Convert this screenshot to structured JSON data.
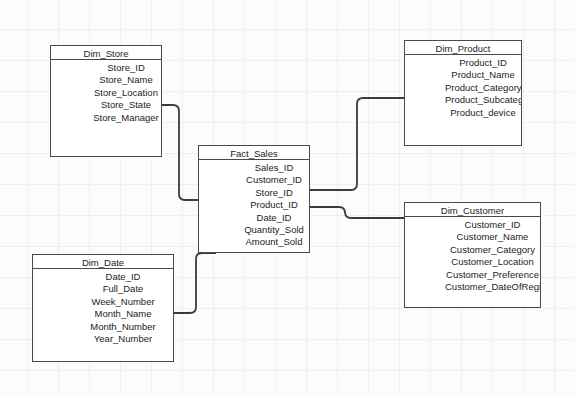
{
  "diagram": {
    "type": "entity-relationship-diagram",
    "canvas": {
      "width": 575,
      "height": 395,
      "background": "#fcfcfc",
      "grid_pitch": 31
    },
    "style": {
      "border_color": "#4a4a4a",
      "fill_color": "#ffffff",
      "text_color": "#1c1c1c",
      "connector_color": "#3c3c3c"
    },
    "entities": [
      {
        "id": "dim_store",
        "name": "Dim_Store",
        "kind": "dimension",
        "x": 50,
        "y": 45,
        "width": 112,
        "height": 112,
        "fields": [
          "Store_ID",
          "Store_Name",
          "Store_Location",
          "Store_State",
          "Store_Manager"
        ]
      },
      {
        "id": "fact_sales",
        "name": "Fact_Sales",
        "kind": "fact",
        "x": 198,
        "y": 145,
        "width": 112,
        "height": 108,
        "fields": [
          "Sales_ID",
          "Customer_ID",
          "Store_ID",
          "Product_ID",
          "Date_ID",
          "Quantity_Sold",
          "Amount_Sold"
        ]
      },
      {
        "id": "dim_product",
        "name": "Dim_Product",
        "kind": "dimension",
        "x": 404,
        "y": 40,
        "width": 118,
        "height": 106,
        "fields": [
          "Product_ID",
          "Product_Name",
          "Product_Category",
          "Product_Subcategory",
          "Product_device"
        ]
      },
      {
        "id": "dim_customer",
        "name": "Dim_Customer",
        "kind": "dimension",
        "x": 404,
        "y": 202,
        "width": 137,
        "height": 106,
        "fields": [
          "Customer_ID",
          "Customer_Name",
          "Customer_Category",
          "Customer_Location",
          "Customer_Preference",
          "Customer_DateOfRegistration"
        ]
      },
      {
        "id": "dim_date",
        "name": "Dim_Date",
        "kind": "dimension",
        "x": 32,
        "y": 254,
        "width": 142,
        "height": 108,
        "fields": [
          "Date_ID",
          "Full_Date",
          "Week_Number",
          "Month_Name",
          "Month_Number",
          "Year_Number"
        ]
      }
    ],
    "relationships": [
      {
        "id": "rel_store_fact",
        "from": "dim_store",
        "to": "fact_sales",
        "from_field": "Store_ID",
        "to_field": "Store_ID",
        "path": "M 162 105 L 173 105 Q 179 105 179 111 L 179 194 Q 179 200 185 200 L 198 200"
      },
      {
        "id": "rel_fact_product",
        "from": "fact_sales",
        "to": "dim_product",
        "from_field": "Product_ID",
        "to_field": "Product_ID",
        "path": "M 310 190 L 351 190 Q 357 190 357 184 L 357 104 Q 357 98 363 98 L 404 98"
      },
      {
        "id": "rel_fact_customer",
        "from": "fact_sales",
        "to": "dim_customer",
        "from_field": "Customer_ID",
        "to_field": "Customer_ID",
        "path": "M 310 207 L 339 207 Q 345 207 345 213 L 345 212 Q 345 218 351 218 L 404 218"
      },
      {
        "id": "rel_date_fact",
        "from": "dim_date",
        "to": "fact_sales",
        "from_field": "Date_ID",
        "to_field": "Date_ID",
        "path": "M 174 313 L 190 313 Q 196 313 196 307 L 196 259 Q 196 253 202 253 L 216 253"
      }
    ]
  }
}
